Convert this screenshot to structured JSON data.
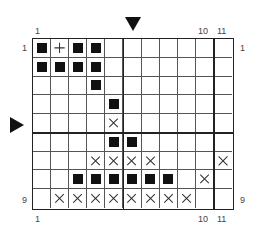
{
  "chart_data": {
    "type": "knitting-chart",
    "columns": 11,
    "rows": 9,
    "legend_symbols": {
      "B": "filled-square",
      "X": "cross",
      "+": "plus",
      ".": "empty"
    },
    "grid": [
      "B+BB.......",
      "BBBB.......",
      "...B.......",
      "....B......",
      "....X......",
      "....BB.....",
      "...XXXX...X",
      "..BBBBBB.X.",
      ".XXXXXXXX.."
    ],
    "thick_vertical_after_columns": [
      5,
      10
    ],
    "thick_horizontal_after_rows": [
      5
    ],
    "markers": {
      "column_marker_after_column": 5,
      "row_marker_at_row": 5
    }
  },
  "labels": {
    "top_left_col": "1",
    "top_col_10": "10",
    "top_col_11": "11",
    "bottom_left_col": "1",
    "bottom_col_10": "10",
    "bottom_col_11": "11",
    "left_row_1": "1",
    "left_row_9": "9",
    "right_row_1": "1",
    "right_row_9": "9"
  }
}
